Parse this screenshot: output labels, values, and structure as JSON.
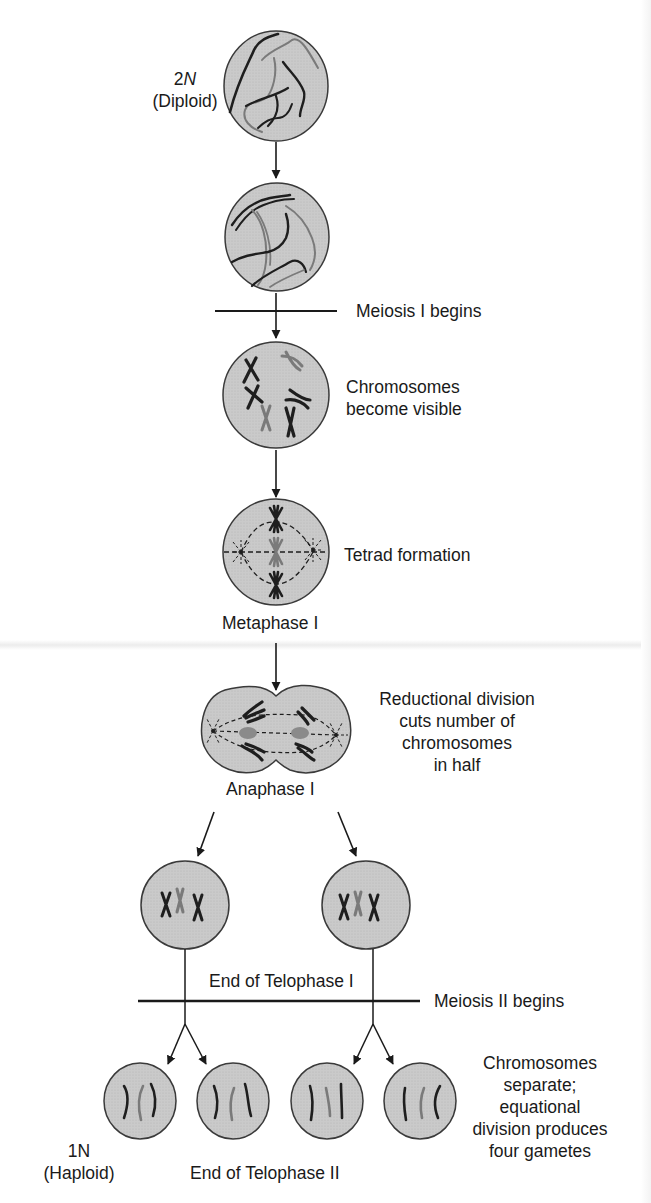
{
  "diagram": {
    "type": "meiosis-flowchart",
    "stages": [
      {
        "id": "diploid-cell",
        "label_line1": "2N",
        "label_line2": "(Diploid)"
      },
      {
        "id": "replicated-cell"
      },
      {
        "id": "meiosis-i-boundary",
        "label": "Meiosis I begins"
      },
      {
        "id": "prophase-cell",
        "label_line1": "Chromosomes",
        "label_line2": "become visible"
      },
      {
        "id": "metaphase-cell",
        "label": "Tetrad formation",
        "caption": "Metaphase I"
      },
      {
        "id": "anaphase-cell",
        "label_lines": [
          "Reductional division",
          "cuts number of",
          "chromosomes",
          "in half"
        ],
        "caption": "Anaphase I"
      },
      {
        "id": "telophase-i-cells",
        "caption": "End of Telophase I"
      },
      {
        "id": "meiosis-ii-boundary",
        "label": "Meiosis II begins"
      },
      {
        "id": "gamete-cells",
        "label_line1": "1N",
        "label_line2": "(Haploid)",
        "caption": "End of Telophase II",
        "note_lines": [
          "Chromosomes",
          "separate;",
          "equational",
          "division produces",
          "four gametes"
        ]
      }
    ]
  },
  "colors": {
    "cell_fill": "#c9c9c9",
    "cell_stroke": "#3a3a3a",
    "chromosome_dark": "#1e1e1e",
    "chromosome_gray": "#7a7a7a",
    "text": "#1a1a1a"
  }
}
